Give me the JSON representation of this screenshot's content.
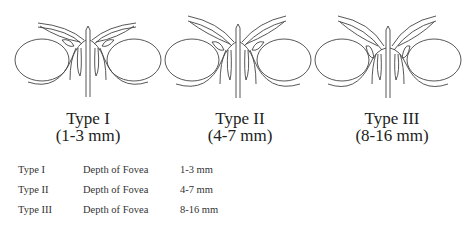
{
  "figures": [
    {
      "type": "Type I",
      "range": "(1-3 mm)",
      "variant": "shallow"
    },
    {
      "type": "Type II",
      "range": "(4-7 mm)",
      "variant": "medium"
    },
    {
      "type": "Type III",
      "range": "(8-16 mm)",
      "variant": "deep"
    }
  ],
  "table": {
    "rows": [
      {
        "type": "Type I",
        "label": "Depth of Fovea",
        "value": "1-3 mm"
      },
      {
        "type": "Type II",
        "label": "Depth of Fovea",
        "value": "4-7 mm"
      },
      {
        "type": "Type III",
        "label": "Depth of Fovea",
        "value": "8-16 mm"
      }
    ]
  },
  "colors": {
    "stroke": "#444444",
    "text": "#222222"
  }
}
